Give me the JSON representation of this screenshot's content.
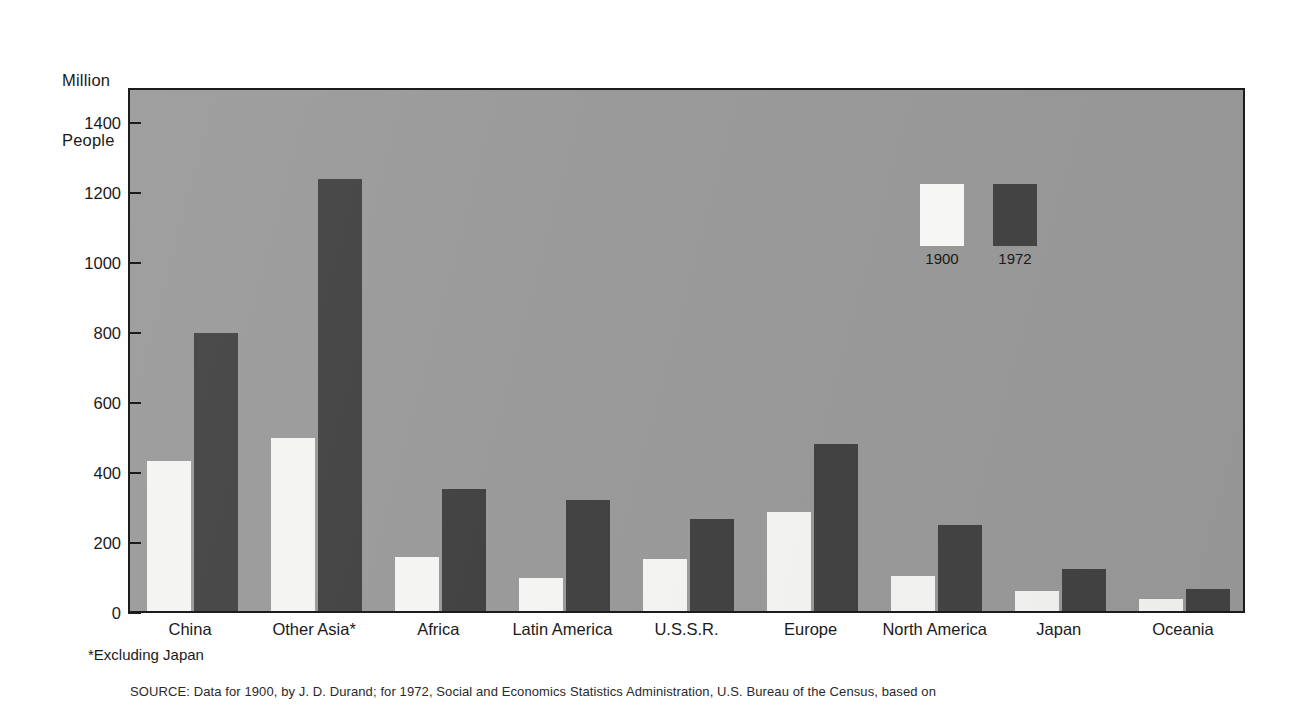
{
  "axis_caption": {
    "line1": "Million",
    "line2": "People"
  },
  "footnote": "*Excluding Japan",
  "source_note": "SOURCE: Data for 1900, by J. D. Durand; for 1972, Social and Economics Statistics Administration, U.S. Bureau of the Census, based on",
  "legend": {
    "items": [
      {
        "label": "1900",
        "swatch": "white-swatch",
        "color": "#f6f6f4"
      },
      {
        "label": "1972",
        "swatch": "dark-swatch",
        "color": "#434343"
      }
    ]
  },
  "colors": {
    "plot_background": "#9a9a9a",
    "axis": "#1c1c1c",
    "series_1900": "#f4f4f2",
    "series_1972": "#434343",
    "page_background": "#ffffff"
  },
  "chart_data": {
    "type": "bar",
    "title": "",
    "subtitle": "",
    "xlabel": "",
    "ylabel": "Million People",
    "ylim": [
      0,
      1500
    ],
    "yticks": [
      0,
      200,
      400,
      600,
      800,
      1000,
      1200,
      1400
    ],
    "ytick_labels": [
      "0",
      "200",
      "400",
      "600",
      "800",
      "1000",
      "1200",
      "1400"
    ],
    "grid": false,
    "legend_position": "inside-upper-right",
    "categories": [
      "China",
      "Other Asia*",
      "Africa",
      "Latin America",
      "U.S.S.R.",
      "Europe",
      "North America",
      "Japan",
      "Oceania"
    ],
    "series": [
      {
        "name": "1900",
        "color": "#f4f4f2",
        "values": [
          430,
          495,
          155,
          95,
          150,
          282,
          100,
          57,
          35
        ]
      },
      {
        "name": "1972",
        "color": "#434343",
        "values": [
          795,
          1235,
          350,
          318,
          263,
          478,
          245,
          120,
          62
        ]
      }
    ],
    "annotations": [
      "*Excluding Japan"
    ]
  }
}
